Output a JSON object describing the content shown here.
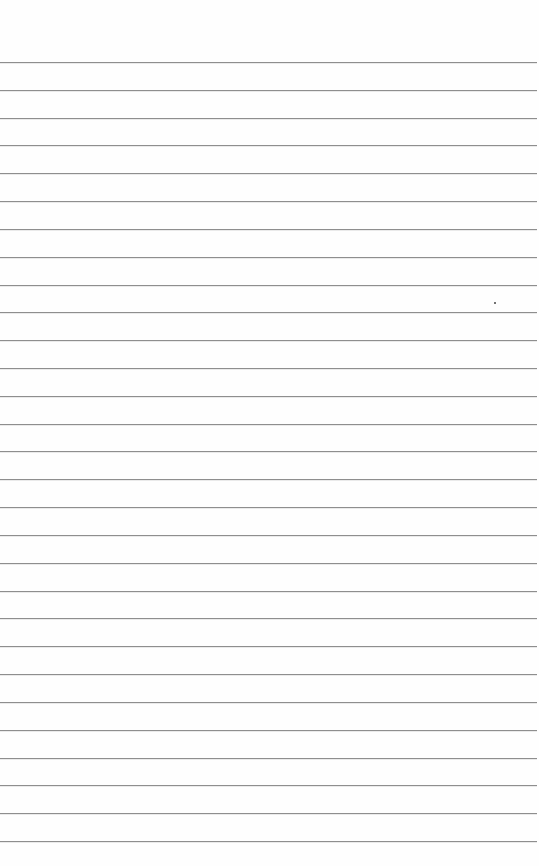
{
  "paper": {
    "type": "lined-notebook-paper",
    "background": "#fefefe",
    "rule_color": "#8e8e8e",
    "first_rule_y": 62,
    "rule_spacing": 27.82,
    "rule_count": 29
  },
  "marks": [
    {
      "name": "speck",
      "x": 494,
      "y": 302
    }
  ]
}
